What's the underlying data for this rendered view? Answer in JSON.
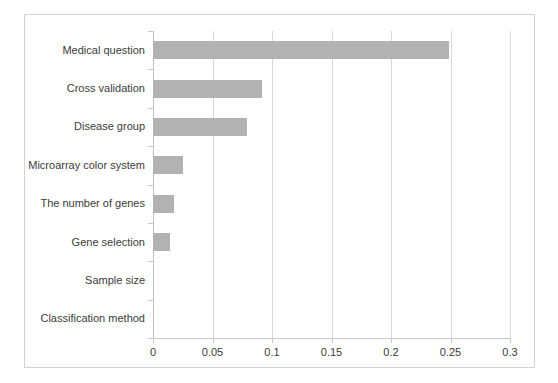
{
  "chart_data": {
    "type": "bar",
    "orientation": "horizontal",
    "title": "",
    "subtitle": "",
    "xlabel": "",
    "ylabel": "",
    "categories": [
      "Medical question",
      "Cross validation",
      "Disease group",
      "Microarray color system",
      "The number of genes",
      "Gene selection",
      "Sample size",
      "Classification method"
    ],
    "values": [
      0.249,
      0.092,
      0.079,
      0.025,
      0.018,
      0.014,
      0.0,
      0.0
    ],
    "xlim": [
      0,
      0.3
    ],
    "xticks": [
      0,
      0.05,
      0.1,
      0.15,
      0.2,
      0.25,
      0.3
    ],
    "xtick_labels": [
      "0",
      "0.05",
      "0.1",
      "0.15",
      "0.2",
      "0.25",
      "0.3"
    ],
    "grid": "vertical",
    "legend": "none",
    "bar_color": "#b2b2b2",
    "gridline_color": "#d9d9d9",
    "axis_color": "#c9c9c9",
    "frame_color": "#d2d2d2",
    "text_color": "#3b3b3b",
    "background": "#ffffff"
  }
}
